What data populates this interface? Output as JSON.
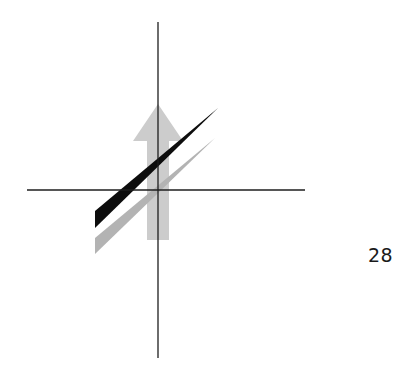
{
  "figure": {
    "page_number": "28",
    "colors": {
      "axes": "#1e1e1e",
      "arrow": "#cccccc",
      "black_wedge": "#0d0d0d",
      "gray_wedge": "#b3b3b3",
      "background": "#ffffff"
    },
    "axes": {
      "vertical": {
        "x": 158,
        "y1": 22,
        "y2": 358
      },
      "horizontal": {
        "y": 190,
        "x1": 27,
        "x2": 305
      }
    },
    "arrow": {
      "direction": "up",
      "tip": [
        158,
        104
      ],
      "head_left": [
        133,
        141
      ],
      "head_right": [
        183,
        141
      ],
      "shaft_left": 147,
      "shaft_right": 169,
      "shaft_bottom": 240
    },
    "black_wedge": {
      "tip": [
        218,
        108
      ],
      "base_top": [
        95,
        211
      ],
      "base_bottom": [
        95,
        228
      ]
    },
    "gray_wedge": {
      "tip": [
        215,
        138
      ],
      "base_top": [
        95,
        238
      ],
      "base_bottom": [
        95,
        254
      ]
    }
  }
}
